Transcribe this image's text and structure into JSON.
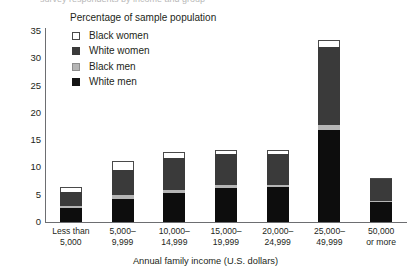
{
  "top_cut_text": "survey respondents by income and group",
  "legend": {
    "title": "Percentage of sample population",
    "items": [
      {
        "label": "Black women",
        "key": "black_women",
        "color": "#ffffff"
      },
      {
        "label": "White women",
        "key": "white_women",
        "color": "#3a3a3a"
      },
      {
        "label": "Black men",
        "key": "black_men",
        "color": "#b5b5b5"
      },
      {
        "label": "White men",
        "key": "white_men",
        "color": "#0d0d0d"
      }
    ]
  },
  "axes": {
    "x_title": "Annual family income (U.S. dollars)",
    "y_ticks": [
      "0",
      "5",
      "10",
      "15",
      "20",
      "25",
      "30",
      "35"
    ]
  },
  "chart_data": {
    "type": "bar",
    "title": "Percentage of sample population",
    "xlabel": "Annual family income (U.S. dollars)",
    "ylabel": "Percentage of sample population",
    "ylim": [
      0,
      35
    ],
    "yticks": [
      0,
      5,
      10,
      15,
      20,
      25,
      30,
      35
    ],
    "grid": false,
    "stacked": true,
    "legend_position": "top-left-inside",
    "categories": [
      "Less than 5,000",
      "5,000-9,999",
      "10,000-14,999",
      "15,000-19,999",
      "20,000-24,999",
      "25,000-49,999",
      "50,000 or more"
    ],
    "category_lines": [
      [
        "Less than",
        "5,000"
      ],
      [
        "5,000–",
        "9,999"
      ],
      [
        "10,000–",
        "14,999"
      ],
      [
        "15,000–",
        "19,999"
      ],
      [
        "20,000–",
        "24,999"
      ],
      [
        "25,000–",
        "49,999"
      ],
      [
        "50,000",
        "or more"
      ]
    ],
    "series": [
      {
        "name": "White men",
        "color": "#0d0d0d",
        "values": [
          2.5,
          4.2,
          5.3,
          6.2,
          6.4,
          16.8,
          3.7
        ]
      },
      {
        "name": "Black men",
        "color": "#b5b5b5",
        "values": [
          0.4,
          0.7,
          0.6,
          0.5,
          0.4,
          1.0,
          0.2
        ]
      },
      {
        "name": "White women",
        "color": "#3a3a3a",
        "values": [
          2.6,
          4.6,
          5.9,
          5.7,
          5.7,
          14.2,
          3.9
        ]
      },
      {
        "name": "Black women",
        "color": "#ffffff",
        "values": [
          0.9,
          1.7,
          1.0,
          0.8,
          0.7,
          1.3,
          0.2
        ]
      }
    ],
    "totals": [
      6.4,
      11.2,
      12.8,
      13.2,
      13.2,
      33.3,
      8.0
    ]
  }
}
